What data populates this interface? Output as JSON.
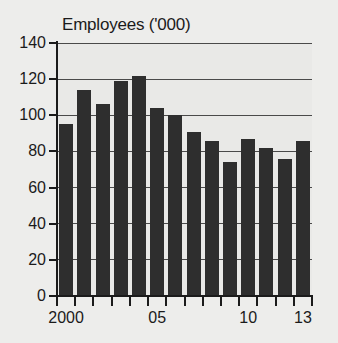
{
  "chart_data": {
    "type": "bar",
    "title": "Employees ('000)",
    "xlabel": "",
    "ylabel": "",
    "ylim": [
      0,
      140
    ],
    "yticks": [
      0,
      20,
      40,
      60,
      80,
      100,
      120,
      140
    ],
    "ytick_labels": [
      "0",
      "20",
      "40",
      "60",
      "80",
      "100",
      "120",
      "140"
    ],
    "grid": true,
    "legend": "none",
    "bar_color": "#2e2e2e",
    "background_color": "#ededeb",
    "plot_background_color": "#e9e9e7",
    "axis_color": "#1b1b1b",
    "gridline_color": "#4a4a4a",
    "categories": [
      "2000",
      "2001",
      "2002",
      "2003",
      "2004",
      "2005",
      "2006",
      "2007",
      "2008",
      "2009",
      "2010",
      "2011",
      "2012",
      "2013"
    ],
    "xtick_labels": [
      "2000",
      "05",
      "10",
      "13"
    ],
    "xtick_categories": [
      "2000",
      "2005",
      "2010",
      "2013"
    ],
    "values": [
      95,
      114,
      106,
      119,
      122,
      104,
      100,
      91,
      86,
      74,
      87,
      82,
      76,
      86
    ]
  }
}
